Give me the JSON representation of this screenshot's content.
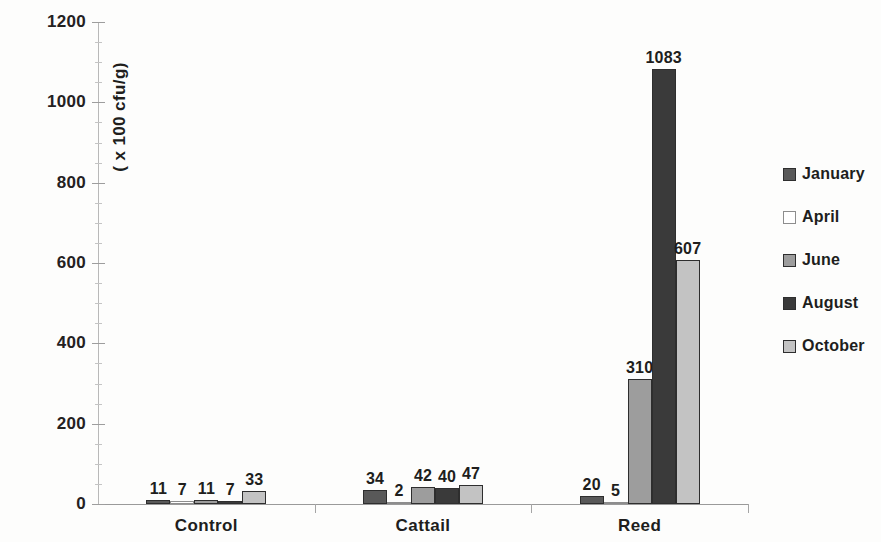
{
  "chart_data": {
    "type": "bar",
    "title": "",
    "xlabel": "",
    "ylabel": "( x 100 cfu/g)",
    "ylim": [
      0,
      1200
    ],
    "ytick_labels": [
      "1200",
      "1000",
      "800",
      "600",
      "400",
      "200",
      "0"
    ],
    "ytick_values": [
      1200,
      1000,
      800,
      600,
      400,
      200,
      0
    ],
    "ytick_interval": 200,
    "minor_tick_interval": 50,
    "grid": false,
    "legend_position": "right",
    "categories": [
      "Control",
      "Cattail",
      "Reed"
    ],
    "series": [
      {
        "name": "January",
        "color": "#595959",
        "values": [
          11,
          34,
          20
        ]
      },
      {
        "name": "April",
        "color": "#ffffff",
        "values": [
          7,
          2,
          5
        ]
      },
      {
        "name": "June",
        "color": "#9d9d9d",
        "values": [
          11,
          42,
          310
        ]
      },
      {
        "name": "August",
        "color": "#3a3a3a",
        "values": [
          7,
          40,
          1083
        ]
      },
      {
        "name": "October",
        "color": "#c3c3c3",
        "values": [
          33,
          47,
          607
        ]
      }
    ],
    "data_labels": {
      "Control": [
        "11",
        "7",
        "11",
        "7",
        "33"
      ],
      "Cattail": [
        "34",
        "2",
        "42",
        "40",
        "47"
      ],
      "Reed": [
        "20",
        "5",
        "310",
        "1083",
        "607"
      ]
    }
  },
  "legend": {
    "items": [
      {
        "label": "January",
        "swatch": "legend-swatch-january"
      },
      {
        "label": "April",
        "swatch": "legend-swatch-april"
      },
      {
        "label": "June",
        "swatch": "legend-swatch-june"
      },
      {
        "label": "August",
        "swatch": "legend-swatch-august"
      },
      {
        "label": "October",
        "swatch": "legend-swatch-october"
      }
    ]
  }
}
